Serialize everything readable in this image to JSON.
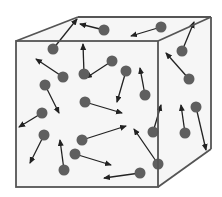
{
  "diagram": {
    "title": "Gas particles moving randomly inside a closed box",
    "colors": {
      "background": "#ffffff",
      "face_fill": "#f6f6f6",
      "front_edge": "#555555",
      "back_edge": "#a8a8a8",
      "particle": "#5f5f5f",
      "arrow": "#222222"
    },
    "cube": {
      "front": {
        "x1": 16,
        "y1": 41,
        "x2": 158,
        "y2": 187
      },
      "back": {
        "x1": 78,
        "y1": 17,
        "x2": 211,
        "y2": 149
      }
    },
    "particles": [
      {
        "x": 53,
        "y": 49,
        "ax": 77,
        "ay": 19
      },
      {
        "x": 104,
        "y": 30,
        "ax": 80,
        "ay": 24
      },
      {
        "x": 161,
        "y": 27,
        "ax": 131,
        "ay": 36
      },
      {
        "x": 182,
        "y": 51,
        "ax": 194,
        "ay": 22
      },
      {
        "x": 63,
        "y": 77,
        "ax": 36,
        "ay": 59
      },
      {
        "x": 112,
        "y": 61,
        "ax": 86,
        "ay": 78
      },
      {
        "x": 126,
        "y": 71,
        "ax": 117,
        "ay": 102
      },
      {
        "x": 84,
        "y": 74,
        "ax": 83,
        "ay": 44
      },
      {
        "x": 45,
        "y": 85,
        "ax": 59,
        "ay": 113
      },
      {
        "x": 145,
        "y": 95,
        "ax": 140,
        "ay": 68
      },
      {
        "x": 189,
        "y": 79,
        "ax": 166,
        "ay": 53
      },
      {
        "x": 196,
        "y": 107,
        "ax": 206,
        "ay": 150
      },
      {
        "x": 42,
        "y": 113,
        "ax": 19,
        "ay": 127
      },
      {
        "x": 85,
        "y": 102,
        "ax": 122,
        "ay": 113
      },
      {
        "x": 44,
        "y": 135,
        "ax": 30,
        "ay": 163
      },
      {
        "x": 82,
        "y": 140,
        "ax": 126,
        "ay": 126
      },
      {
        "x": 153,
        "y": 132,
        "ax": 161,
        "ay": 105
      },
      {
        "x": 185,
        "y": 133,
        "ax": 181,
        "ay": 105
      },
      {
        "x": 75,
        "y": 154,
        "ax": 111,
        "ay": 165
      },
      {
        "x": 64,
        "y": 170,
        "ax": 60,
        "ay": 140
      },
      {
        "x": 158,
        "y": 164,
        "ax": 134,
        "ay": 129
      },
      {
        "x": 140,
        "y": 173,
        "ax": 104,
        "ay": 178
      }
    ]
  }
}
